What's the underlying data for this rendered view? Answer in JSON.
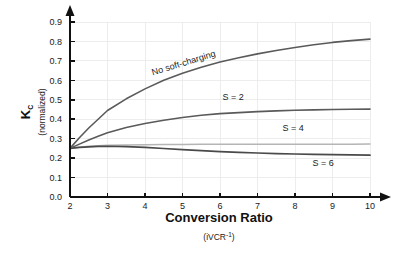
{
  "chart_data": {
    "type": "line",
    "title": "",
    "xlabel": "Conversion Ratio",
    "xlabel_sub": "(iVCR",
    "xlabel_sub_exp": "-1",
    "xlabel_sub_close": ")",
    "ylabel": "K",
    "ylabel_subscript": "C",
    "ylabel_sub": "(normalized)",
    "xlim": [
      2,
      10
    ],
    "ylim": [
      0.0,
      0.9
    ],
    "grid": true,
    "legend_position": "inline-annotations",
    "xticks": [
      "2",
      "3",
      "4",
      "5",
      "6",
      "7",
      "8",
      "9",
      "10"
    ],
    "xtick_values": [
      2,
      3,
      4,
      5,
      6,
      7,
      8,
      9,
      10
    ],
    "yticks": [
      "0.0",
      "0.1",
      "0.2",
      "0.3",
      "0.4",
      "0.5",
      "0.6",
      "0.7",
      "0.8",
      "0.9"
    ],
    "ytick_values": [
      0.0,
      0.1,
      0.2,
      0.3,
      0.4,
      0.5,
      0.6,
      0.7,
      0.8,
      0.9
    ],
    "x": [
      2,
      2.25,
      2.5,
      2.75,
      3,
      3.5,
      4,
      4.5,
      5,
      5.5,
      6,
      6.5,
      7,
      7.5,
      8,
      8.5,
      9,
      9.5,
      10
    ],
    "series": [
      {
        "name": "No soft-charging",
        "label": "No soft-charging",
        "color": "#5a5a5a",
        "width": 1.6,
        "label_x": 5.05,
        "label_y": 0.675,
        "label_rotation": -17,
        "values": [
          0.25,
          0.305,
          0.355,
          0.4,
          0.445,
          0.505,
          0.556,
          0.6,
          0.637,
          0.667,
          0.694,
          0.716,
          0.736,
          0.753,
          0.769,
          0.783,
          0.795,
          0.804,
          0.812
        ]
      },
      {
        "name": "S = 2",
        "label": "S = 2",
        "color": "#5a5a5a",
        "width": 1.6,
        "label_x": 6.35,
        "label_y": 0.5,
        "label_rotation": 0,
        "values": [
          0.25,
          0.272,
          0.293,
          0.312,
          0.33,
          0.357,
          0.378,
          0.395,
          0.409,
          0.42,
          0.429,
          0.434,
          0.439,
          0.443,
          0.446,
          0.448,
          0.45,
          0.451,
          0.452
        ]
      },
      {
        "name": "S = 4",
        "label": "S = 4",
        "color": "#b5b5b5",
        "width": 1.5,
        "label_x": 7.95,
        "label_y": 0.337,
        "label_rotation": 0,
        "values": [
          0.25,
          0.256,
          0.261,
          0.264,
          0.266,
          0.268,
          0.269,
          0.27,
          0.2705,
          0.271,
          0.271,
          0.2712,
          0.2714,
          0.2715,
          0.2716,
          0.2717,
          0.2718,
          0.2719,
          0.272
        ]
      },
      {
        "name": "S = 6",
        "label": "S = 6",
        "color": "#4a4a4a",
        "width": 1.7,
        "label_x": 8.75,
        "label_y": 0.158,
        "label_rotation": 0,
        "values": [
          0.25,
          0.255,
          0.258,
          0.26,
          0.261,
          0.259,
          0.255,
          0.2495,
          0.2435,
          0.238,
          0.2335,
          0.2295,
          0.2262,
          0.2235,
          0.2212,
          0.2192,
          0.2175,
          0.2162,
          0.2152
        ]
      }
    ]
  },
  "figure": {
    "background_color": "#ffffff",
    "grid_color": "#e9e9e9",
    "axis_color": "#111111"
  }
}
